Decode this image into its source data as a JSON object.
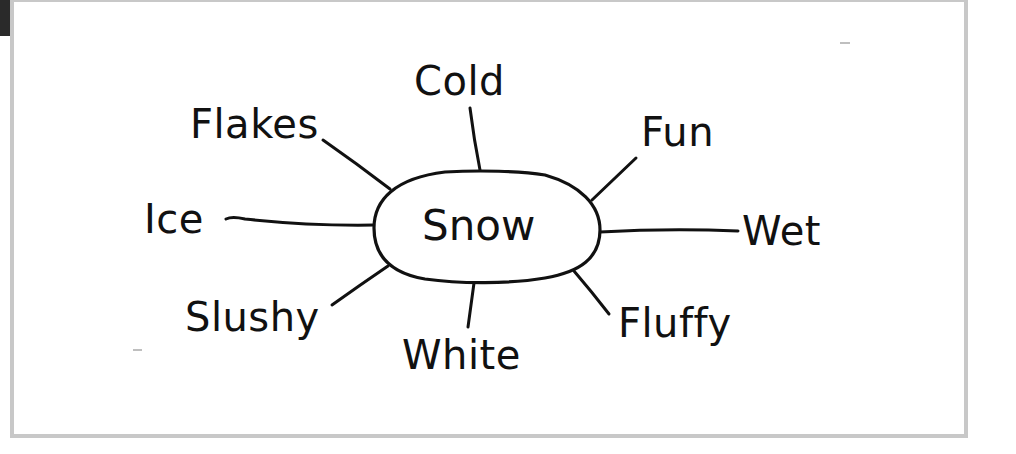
{
  "diagram": {
    "type": "word-web",
    "center": {
      "label": "Snow",
      "x": 487,
      "y": 226,
      "rx": 113,
      "ry": 56
    },
    "nodes": [
      {
        "id": "cold",
        "label": "Cold",
        "text_x": 414,
        "text_y": 95,
        "line": [
          470,
          108,
          480,
          170
        ]
      },
      {
        "id": "flakes",
        "label": "Flakes",
        "text_x": 190,
        "text_y": 138,
        "line": [
          323,
          140,
          390,
          189
        ]
      },
      {
        "id": "fun",
        "label": "Fun",
        "text_x": 641,
        "text_y": 146,
        "line": [
          636,
          158,
          592,
          200
        ]
      },
      {
        "id": "ice",
        "label": "Ice",
        "text_x": 144,
        "text_y": 233,
        "line": [
          226,
          219,
          374,
          225
        ]
      },
      {
        "id": "wet",
        "label": "Wet",
        "text_x": 742,
        "text_y": 245,
        "line": [
          600,
          232,
          738,
          231
        ]
      },
      {
        "id": "slushy",
        "label": "Slushy",
        "text_x": 185,
        "text_y": 331,
        "line": [
          332,
          305,
          388,
          266
        ]
      },
      {
        "id": "white",
        "label": "White",
        "text_x": 402,
        "text_y": 369,
        "line": [
          474,
          283,
          468,
          327
        ]
      },
      {
        "id": "fluffy",
        "label": "Fluffy",
        "text_x": 618,
        "text_y": 337,
        "line": [
          574,
          271,
          609,
          314
        ]
      }
    ],
    "colors": {
      "ink": "#111111",
      "frame": "#c8c8c8",
      "background": "#ffffff"
    }
  }
}
